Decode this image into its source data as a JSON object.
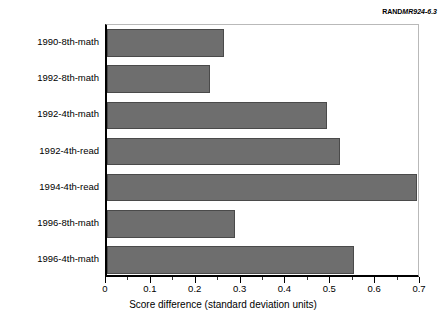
{
  "credit": {
    "brand": "RAND",
    "document_number": "MR924-6.3"
  },
  "chart_data": {
    "type": "bar",
    "orientation": "horizontal",
    "title": "",
    "subtitle": "",
    "xlabel": "Score difference (standard deviation units)",
    "ylabel": "",
    "categories": [
      "1990-8th-math",
      "1992-8th-math",
      "1992-4th-math",
      "1992-4th-read",
      "1994-4th-read",
      "1996-8th-math",
      "1996-4th-math"
    ],
    "values": [
      0.26,
      0.23,
      0.49,
      0.52,
      0.69,
      0.285,
      0.55
    ],
    "xlim": [
      0,
      0.7
    ],
    "xticks": [
      0,
      0.1,
      0.2,
      0.3,
      0.4,
      0.5,
      0.6,
      0.7
    ],
    "xticklabels": [
      "0",
      "0.1",
      "0.2",
      "0.3",
      "0.4",
      "0.5",
      "0.6",
      "0.7"
    ],
    "minor_tick_step": 0.05,
    "grid": false,
    "legend": null,
    "bar_color": "#6e6e6e",
    "bar_edge_color": "#4a4a4a",
    "background_color": "#ffffff",
    "axis_color": "#000000"
  }
}
